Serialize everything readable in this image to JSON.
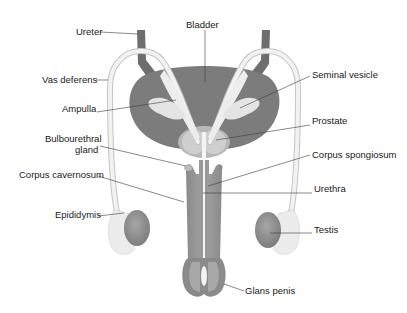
{
  "diagram": {
    "colors": {
      "bladder": "#7c7c7c",
      "ureter": "#6e6e6e",
      "shaft": "#8c8c8c",
      "shaft_light": "#a8a8a8",
      "duct": "#e6e6e6",
      "duct_outline": "#c8c8c8",
      "gland": "#d4d4d4",
      "testis": "#8a8a8a",
      "epididymis": "#ececec",
      "label": "#1a1a1a"
    },
    "labels": {
      "ureter": "Ureter",
      "bladder": "Bladder",
      "vas_deferens": "Vas deferens",
      "seminal_vesicle": "Seminal vesicle",
      "ampulla": "Ampulla",
      "prostate": "Prostate",
      "bulbourethral_1": "Bulbourethral",
      "bulbourethral_2": "gland",
      "corpus_spongiosum": "Corpus spongiosum",
      "corpus_cavernosum": "Corpus cavernosum",
      "urethra": "Urethra",
      "epididymis": "Epididymis",
      "testis": "Testis",
      "glans_penis": "Glans penis"
    }
  }
}
